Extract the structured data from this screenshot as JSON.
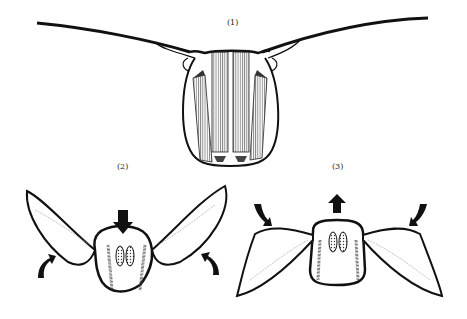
{
  "figure": {
    "panels": [
      {
        "id": "panel-1",
        "label": "(1)",
        "description": "Thorax cross-section with wings extended horizontally, longitudinal and dorsoventral flight muscles shown"
      },
      {
        "id": "panel-2",
        "label": "(2)",
        "description": "Downward arrow on tergum; wings rise (upstroke), curved arrows pointing up"
      },
      {
        "id": "panel-3",
        "label": "(3)",
        "description": "Upward arrow on tergum; wings move down (downstroke), curved arrows pointing down"
      }
    ],
    "colors": {
      "ink": "#111111",
      "background": "#ffffff",
      "hatch": "#555555"
    }
  }
}
